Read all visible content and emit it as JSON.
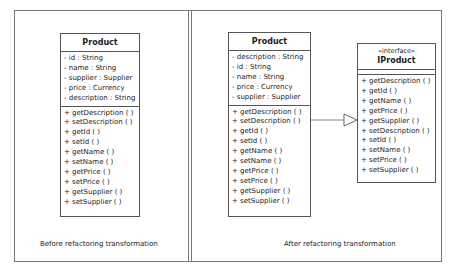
{
  "panels": {
    "before": {
      "caption": "Before refactoring transformation",
      "class": {
        "name": "Product",
        "attributes": [
          "- id : String",
          "- name : String",
          "- supplier : Supplier",
          "- price : Currency",
          "- description : String"
        ],
        "operations": [
          "+ getDescription (  )",
          "+ setDescription (  )",
          "+ getId (  )",
          "+ setId (  )",
          "+ getName (  )",
          "+ setName (  )",
          "+ getPrice (  )",
          "+ setPrice (  )",
          "+ getSupplier (  )",
          "+ setSupplier (  )"
        ]
      }
    },
    "after": {
      "caption": "After refactoring transformation",
      "class": {
        "name": "Product",
        "attributes": [
          "- description : String",
          "- id : String",
          "- name : String",
          "- price : Currency",
          "- supplier : Supplier"
        ],
        "operations": [
          "+ getDescription (  )",
          "+ setDescription (  )",
          "+ getId (  )",
          "+ setId (  )",
          "+ getName (  )",
          "+ setName (  )",
          "+ getPrice (  )",
          "+ setPrice (  )",
          "+ getSupplier (  )",
          "+ setSupplier (  )"
        ]
      },
      "interface": {
        "stereotype": "«interface»",
        "name": "IProduct",
        "operations": [
          "+ getDescription (  )",
          "+ getId (  )",
          "+ getName (  )",
          "+ getPrice (  )",
          "+ getSupplier (  )",
          "+ setDescription (  )",
          "+ setId (  )",
          "+ setName (  )",
          "+ setPrice (  )",
          "+ setSupplier (  )"
        ]
      },
      "relationship": "realization"
    }
  },
  "colors": {
    "border": "#555555",
    "frame": "#777777",
    "text": "#222222"
  }
}
